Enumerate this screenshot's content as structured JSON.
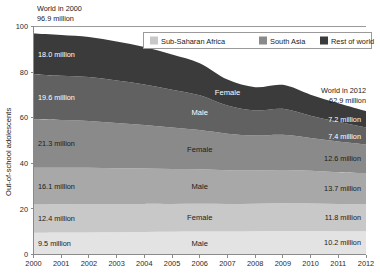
{
  "chart_data": {
    "type": "area",
    "title": "",
    "subtitle": "",
    "xlabel": "",
    "ylabel": "Out-of-school adolescents",
    "x": [
      2000,
      2001,
      2002,
      2003,
      2004,
      2005,
      2006,
      2007,
      2008,
      2009,
      2010,
      2011,
      2012
    ],
    "categories": [
      "2000",
      "2001",
      "2002",
      "2003",
      "2004",
      "2005",
      "2006",
      "2007",
      "2008",
      "2009",
      "2010",
      "2011",
      "2012"
    ],
    "xlim": [
      2000,
      2012
    ],
    "ylim": [
      0,
      100
    ],
    "yticks": [
      0,
      20,
      40,
      60,
      80,
      100
    ],
    "grid": false,
    "legend_position": "top-right",
    "stacked": true,
    "stack_order": "bottom-to-top",
    "series": [
      {
        "name": "Sub-Saharan Africa Male",
        "region": "Sub-Saharan Africa",
        "gender": "Male",
        "color": "#e3e3e3",
        "start_value": 9.5,
        "end_value": 10.2,
        "values": [
          9.5,
          9.6,
          9.7,
          9.8,
          9.9,
          10.0,
          10.1,
          10.1,
          10.2,
          10.3,
          10.3,
          10.2,
          10.2
        ]
      },
      {
        "name": "Sub-Saharan Africa Female",
        "region": "Sub-Saharan Africa",
        "gender": "Female",
        "color": "#c8c8c8",
        "start_value": 12.4,
        "end_value": 11.8,
        "values": [
          12.4,
          12.4,
          12.4,
          12.3,
          12.3,
          12.2,
          12.2,
          12.1,
          12.1,
          12.2,
          12.1,
          11.9,
          11.8
        ]
      },
      {
        "name": "South Asia Male",
        "region": "South Asia",
        "gender": "Male",
        "color": "#a8a8a8",
        "start_value": 16.1,
        "end_value": 13.7,
        "values": [
          16.1,
          16.0,
          15.9,
          15.7,
          15.5,
          15.3,
          15.1,
          14.8,
          14.6,
          14.6,
          14.3,
          14.0,
          13.7
        ]
      },
      {
        "name": "South Asia Female",
        "region": "South Asia",
        "gender": "Female",
        "color": "#8a8a8a",
        "start_value": 21.3,
        "end_value": 12.6,
        "values": [
          21.3,
          21.0,
          20.6,
          19.9,
          19.1,
          18.2,
          17.2,
          16.0,
          15.3,
          15.4,
          14.4,
          13.5,
          12.6
        ]
      },
      {
        "name": "Rest of world Male",
        "region": "Rest of world",
        "gender": "Male",
        "color": "#616161",
        "start_value": 19.6,
        "end_value": 7.4,
        "values": [
          19.6,
          19.4,
          19.2,
          18.6,
          17.8,
          16.6,
          15.2,
          12.3,
          11.0,
          11.4,
          9.8,
          8.6,
          7.4
        ]
      },
      {
        "name": "Rest of world Female",
        "region": "Rest of world",
        "gender": "Female",
        "color": "#3b3b3b",
        "start_value": 18.0,
        "end_value": 7.2,
        "values": [
          18.0,
          17.9,
          17.6,
          17.1,
          16.4,
          15.4,
          14.1,
          11.4,
          10.2,
          10.5,
          9.2,
          8.1,
          7.2
        ]
      }
    ],
    "totals": {
      "2000": 96.9,
      "2012": 62.9
    },
    "annotations": [
      {
        "id": "world-2000",
        "line1": "World in 2000",
        "line2": "96.9 million",
        "anchor": "top-left"
      },
      {
        "id": "world-2012",
        "line1": "World in 2012",
        "line2": "62.9 million",
        "anchor": "top-right"
      }
    ],
    "left_value_labels": [
      "18.0 million",
      "19.6 million",
      "21.3 million",
      "16.1 million",
      "12.4 million",
      "9.5 million"
    ],
    "right_value_labels": [
      "7.2 million",
      "7.4 million",
      "12.6 million",
      "13.7 million",
      "11.8 million",
      "10.2 million"
    ],
    "band_gender_labels": [
      "Female",
      "Male",
      "Female",
      "Male",
      "Female",
      "Male"
    ],
    "legend": [
      {
        "label": "Sub-Saharan Africa",
        "color": "#c8c8c8"
      },
      {
        "label": "South Asia",
        "color": "#8a8a8a"
      },
      {
        "label": "Rest of world",
        "color": "#3b3b3b"
      }
    ]
  },
  "axis": {
    "ylabel": "Out-of-school adolescents",
    "yticks": [
      "0",
      "20",
      "40",
      "60",
      "80",
      "100"
    ],
    "xticks": [
      "2000",
      "2001",
      "2002",
      "2003",
      "2004",
      "2005",
      "2006",
      "2007",
      "2008",
      "2009",
      "2010",
      "2011",
      "2012"
    ]
  },
  "annotations": {
    "left": {
      "line1": "World in 2000",
      "line2": "96.9 million"
    },
    "right": {
      "line1": "World in 2012",
      "line2": "62.9 million"
    }
  },
  "legend": {
    "items": [
      {
        "label": "Sub-Saharan Africa"
      },
      {
        "label": "South Asia"
      },
      {
        "label": "Rest of world"
      }
    ]
  },
  "value_labels": {
    "left": [
      "18.0 million",
      "19.6 million",
      "21.3 million",
      "16.1 million",
      "12.4 million",
      "9.5 million"
    ],
    "right": [
      "7.2 million",
      "7.4 million",
      "12.6 million",
      "13.7 million",
      "11.8 million",
      "10.2 million"
    ],
    "center": [
      "Female",
      "Male",
      "Female",
      "Male",
      "Female",
      "Male"
    ]
  }
}
